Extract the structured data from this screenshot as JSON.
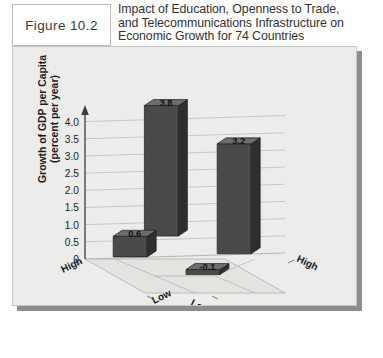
{
  "figure": {
    "label": "Figure 10.2"
  },
  "title": {
    "line1": "Impact of Education, Openness to Trade,",
    "line2": "and Telecommunications Infrastructure on",
    "line3": "Economic Growth for 74 Countries"
  },
  "colors": {
    "panel_bg": "#ececea",
    "bar_front": "#4a4a4a",
    "bar_side": "#2e2e2e",
    "bar_top": "#6e6e6e",
    "grid": "#b4b4b4",
    "axis": "#3c3c3c",
    "shadow": "#8d8d8d"
  },
  "chart_data": {
    "type": "bar",
    "title": "Impact of Education, Openness to Trade, and Telecommunications Infrastructure on Economic Growth for 74 Countries",
    "subtitle": "",
    "xlabel": "Education",
    "zlabel": "Openness to Trade and Supply of Telecommunications Infrastructure",
    "ylabel": "Growth of GDP per Capita (percent per year)",
    "ylim": [
      0,
      4.25
    ],
    "yticks": [
      "0",
      "0.5",
      "1.0",
      "1.5",
      "2.0",
      "2.5",
      "3.0",
      "3.5",
      "4.0"
    ],
    "ytick_values": [
      0,
      0.5,
      1.0,
      1.5,
      2.0,
      2.5,
      3.0,
      3.5,
      4.0
    ],
    "grid": true,
    "legend": "none",
    "projection": "3d",
    "axis_categories": {
      "education": [
        "High",
        "Low"
      ],
      "openness": [
        "Low",
        "High"
      ]
    },
    "categories": [
      "Education High / Openness Low",
      "Education High / Openness High",
      "Education Low / Openness High",
      "Education Low / Openness Low"
    ],
    "values": [
      0.6,
      3.8,
      3.2,
      -0.1
    ],
    "bars": [
      {
        "education": "High",
        "openness": "Low",
        "value": 0.6,
        "label": "0.6",
        "cell": "front-left"
      },
      {
        "education": "High",
        "openness": "High",
        "value": 3.8,
        "label": "3.8",
        "cell": "back-left"
      },
      {
        "education": "Low",
        "openness": "High",
        "value": 3.2,
        "label": "3.2",
        "cell": "back-right"
      },
      {
        "education": "Low",
        "openness": "Low",
        "value": -0.1,
        "label": "-0.1",
        "cell": "front-right"
      }
    ]
  },
  "floor_axis": {
    "education_title": "Education",
    "education_high": "High",
    "education_low": "Low",
    "openness_low": "Low",
    "openness_high": "High",
    "openness_title_line1": "Openness to",
    "openness_title_line2": "Trade and Supply",
    "openness_title_line3": "of Telecommunications",
    "openness_title_line4": "Infrastructure"
  }
}
